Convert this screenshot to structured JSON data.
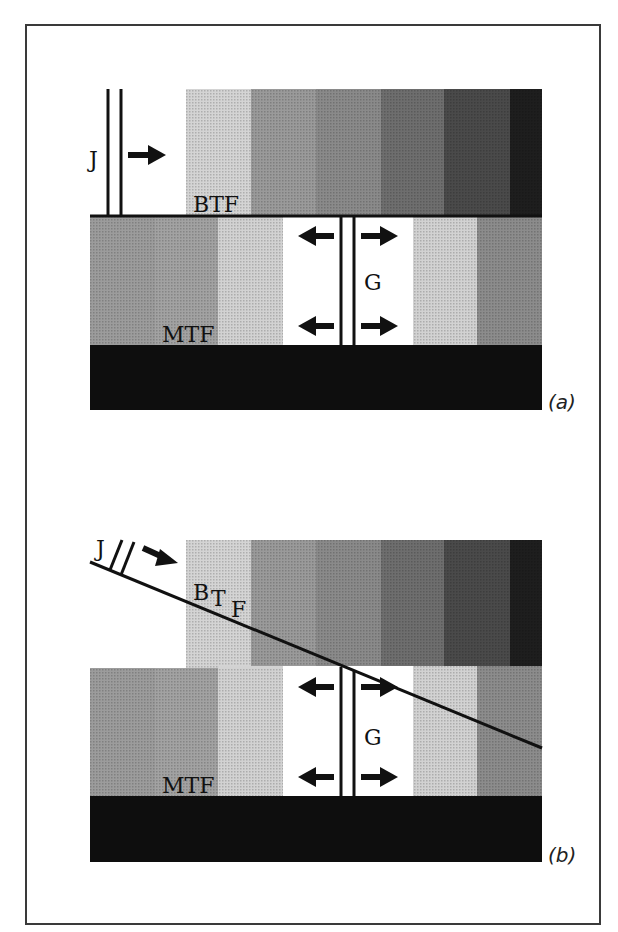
{
  "figure": {
    "panels": [
      {
        "id": "a",
        "caption": "(a)",
        "labels": {
          "front_top": "BTF",
          "front_bottom": "MTF",
          "boundary_j": "J",
          "boundary_g": "G"
        }
      },
      {
        "id": "b",
        "caption": "(b)",
        "labels": {
          "front_top_main": "B",
          "front_top_t": "T",
          "front_top_f": "F",
          "front_bottom": "MTF",
          "boundary_j": "J",
          "boundary_g": "G"
        }
      }
    ],
    "colors": {
      "stripe_light": "#d4d4d4",
      "stripe_mid1": "#9a9a9a",
      "stripe_mid2": "#8a8a8a",
      "stripe_mid3": "#707070",
      "stripe_dark1": "#4a4a4a",
      "stripe_dark2": "#1e1e1e",
      "bottom_band": "#0e0e0e",
      "lower_dark": "#9c9c9c",
      "lower_light": "#d2d2d2",
      "lower_mid": "#8c8c8c",
      "line": "#111111"
    }
  }
}
